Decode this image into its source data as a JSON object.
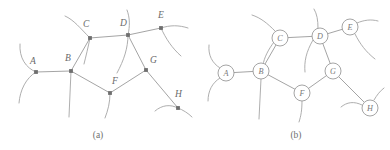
{
  "figure": {
    "background_color": "#ffffff",
    "line_color": "#9a9a9a",
    "node_fill_a": "#6e6e6e",
    "node_fill_b": "#ffffff",
    "label_color": "#6a6a6a",
    "width": 390,
    "height": 150
  },
  "panels": [
    {
      "id": "panel-a",
      "caption": "(a)",
      "caption_x": 98,
      "caption_y": 138,
      "node_style": "filled-square",
      "nodes": [
        {
          "id": "A",
          "label": "A",
          "x": 36,
          "y": 72,
          "label_x": 30,
          "label_y": 64
        },
        {
          "id": "B",
          "label": "B",
          "x": 71,
          "y": 71,
          "label_x": 65,
          "label_y": 61
        },
        {
          "id": "C",
          "label": "C",
          "x": 90,
          "y": 38,
          "label_x": 83,
          "label_y": 27
        },
        {
          "id": "D",
          "label": "D",
          "x": 128,
          "y": 35,
          "label_x": 120,
          "label_y": 26
        },
        {
          "id": "E",
          "label": "E",
          "x": 161,
          "y": 28,
          "label_x": 158,
          "label_y": 18
        },
        {
          "id": "F",
          "label": "F",
          "x": 110,
          "y": 93,
          "label_x": 112,
          "label_y": 84
        },
        {
          "id": "G",
          "label": "G",
          "x": 146,
          "y": 70,
          "label_x": 150,
          "label_y": 63
        },
        {
          "id": "H",
          "label": "H",
          "x": 178,
          "y": 108,
          "label_x": 175,
          "label_y": 97
        }
      ],
      "edges": [
        {
          "from": "A",
          "to": "B"
        },
        {
          "from": "B",
          "to": "C"
        },
        {
          "from": "C",
          "to": "D"
        },
        {
          "from": "D",
          "to": "E"
        },
        {
          "from": "D",
          "to": "G"
        },
        {
          "from": "B",
          "to": "F"
        },
        {
          "from": "F",
          "to": "G"
        },
        {
          "from": "G",
          "to": "H"
        }
      ],
      "stubs": [
        {
          "node": "A",
          "path": "M36,72 C26,68 19,58 20,44"
        },
        {
          "node": "A",
          "path": "M36,72 C26,78 20,90 19,103"
        },
        {
          "node": "C",
          "path": "M90,38 C80,28 74,20 65,16"
        },
        {
          "node": "C",
          "path": "M90,38 C88,48 86,56 84,64"
        },
        {
          "node": "B",
          "path": "M71,71 L69,117"
        },
        {
          "node": "D",
          "path": "M128,35 C130,26 130,18 127,10"
        },
        {
          "node": "D",
          "path": "M128,35 C128,48 124,60 117,73"
        },
        {
          "node": "E",
          "path": "M161,28 C170,25 179,25 188,28"
        },
        {
          "node": "E",
          "path": "M161,28 C166,39 172,48 181,56"
        },
        {
          "node": "F",
          "path": "M110,93 C110,103 108,110 105,118"
        },
        {
          "node": "H",
          "path": "M178,108 C170,104 162,105 155,111"
        },
        {
          "node": "H",
          "path": "M178,108 C183,110 188,113 192,117"
        }
      ]
    },
    {
      "id": "panel-b",
      "caption": "(b)",
      "caption_x": 296,
      "caption_y": 138,
      "node_style": "open-circle",
      "node_radius": 8,
      "nodes": [
        {
          "id": "A",
          "label": "A",
          "x": 226,
          "y": 73
        },
        {
          "id": "B",
          "label": "B",
          "x": 261,
          "y": 71
        },
        {
          "id": "C",
          "label": "C",
          "x": 280,
          "y": 38
        },
        {
          "id": "D",
          "label": "D",
          "x": 320,
          "y": 36
        },
        {
          "id": "E",
          "label": "E",
          "x": 350,
          "y": 27
        },
        {
          "id": "F",
          "label": "F",
          "x": 302,
          "y": 93
        },
        {
          "id": "G",
          "label": "G",
          "x": 333,
          "y": 71
        },
        {
          "id": "H",
          "label": "H",
          "x": 370,
          "y": 108
        }
      ],
      "edges": [
        {
          "from": "A",
          "to": "B"
        },
        {
          "from": "B",
          "to": "C"
        },
        {
          "from": "C",
          "to": "D"
        },
        {
          "from": "D",
          "to": "E"
        },
        {
          "from": "D",
          "to": "G"
        },
        {
          "from": "B",
          "to": "F"
        },
        {
          "from": "F",
          "to": "G"
        },
        {
          "from": "G",
          "to": "H"
        }
      ],
      "stubs": [
        {
          "node": "A",
          "path": "M220,68 C212,63 208,55 209,45"
        },
        {
          "node": "A",
          "path": "M220,78 C212,83 208,91 208,101"
        },
        {
          "node": "C",
          "path": "M275,31 C267,23 261,18 252,15"
        },
        {
          "node": "C",
          "path": "M274,42 C268,50 264,58 263,65"
        },
        {
          "node": "B",
          "path": "M261,79 L259,119"
        },
        {
          "node": "D",
          "path": "M318,28 C318,20 317,14 314,9"
        },
        {
          "node": "D",
          "path": "M313,40 C306,52 304,62 305,72"
        },
        {
          "node": "E",
          "path": "M357,23 C364,20 371,19 378,21"
        },
        {
          "node": "E",
          "path": "M355,34 C360,44 366,52 375,59"
        },
        {
          "node": "F",
          "path": "M302,101 C302,110 301,116 299,122"
        },
        {
          "node": "H",
          "path": "M362,105 C354,101 347,102 341,107"
        },
        {
          "node": "H",
          "path": "M374,100 C377,95 380,91 384,88"
        }
      ]
    }
  ]
}
